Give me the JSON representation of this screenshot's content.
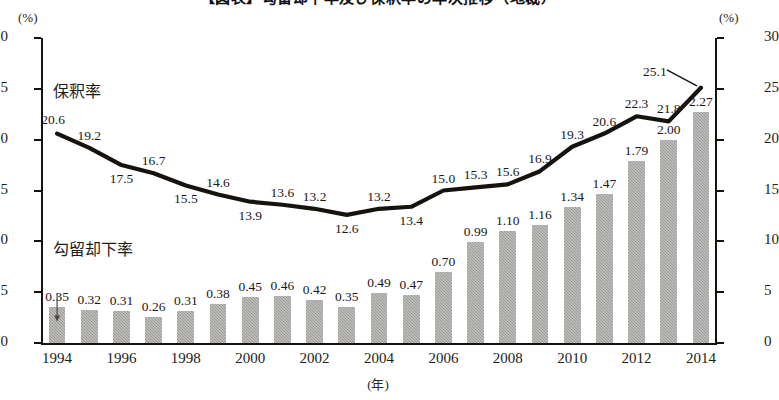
{
  "title": "【図表】勾留却下率及び保釈率の年次推移（地裁）",
  "axes": {
    "left_unit": "(%)",
    "right_unit": "(%)",
    "x_title": "(年)",
    "left_ticks": [
      "0.0",
      "0.5",
      "1.0",
      "1.5",
      "2.0",
      "2.5",
      "3.0"
    ],
    "right_ticks": [
      "0",
      "5",
      "10",
      "15",
      "20",
      "25",
      "30"
    ],
    "x_ticks": [
      "1994",
      "1996",
      "1998",
      "2000",
      "2002",
      "2004",
      "2006",
      "2008",
      "2010",
      "2012",
      "2014"
    ]
  },
  "series_labels": {
    "line": "保釈率",
    "bar": "勾留却下率"
  },
  "colors": {
    "line": "#16130f",
    "bar": "#a9a7a4",
    "axis": "#16130f",
    "text": "#1a1714"
  },
  "chart_data": {
    "type": "bar",
    "title": "【図表】勾留却下率及び保釈率の年次推移（地裁）",
    "xlabel": "(年)",
    "ylabel": "(%)",
    "ylim": [
      0.0,
      3.0
    ],
    "y2lim": [
      0,
      30
    ],
    "grid": false,
    "legend": "in-plot",
    "categories": [
      "1994",
      "1995",
      "1996",
      "1997",
      "1998",
      "1999",
      "2000",
      "2001",
      "2002",
      "2003",
      "2004",
      "2005",
      "2006",
      "2007",
      "2008",
      "2009",
      "2010",
      "2011",
      "2012",
      "2013",
      "2014"
    ],
    "series": [
      {
        "name": "勾留却下率",
        "type": "bar",
        "axis": "left",
        "unit": "%",
        "values": [
          0.35,
          0.32,
          0.31,
          0.26,
          0.31,
          0.38,
          0.45,
          0.46,
          0.42,
          0.35,
          0.49,
          0.47,
          0.7,
          0.99,
          1.1,
          1.16,
          1.34,
          1.47,
          1.79,
          2.0,
          2.27
        ],
        "labels": [
          "0.35",
          "0.32",
          "0.31",
          "0.26",
          "0.31",
          "0.38",
          "0.45",
          "0.46",
          "0.42",
          "0.35",
          "0.49",
          "0.47",
          "0.70",
          "0.99",
          "1.10",
          "1.16",
          "1.34",
          "1.47",
          "1.79",
          "2.00",
          "2.27"
        ]
      },
      {
        "name": "保釈率",
        "type": "line",
        "axis": "right",
        "unit": "%",
        "values": [
          20.6,
          19.2,
          17.5,
          16.7,
          15.5,
          14.6,
          13.9,
          13.6,
          13.2,
          12.6,
          13.2,
          13.4,
          15.0,
          15.3,
          15.6,
          16.9,
          19.3,
          20.6,
          22.3,
          21.8,
          25.1
        ],
        "labels": [
          "20.6",
          "19.2",
          "17.5",
          "16.7",
          "15.5",
          "14.6",
          "13.9",
          "13.6",
          "13.2",
          "12.6",
          "13.2",
          "13.4",
          "15.0",
          "15.3",
          "15.6",
          "16.9",
          "19.3",
          "20.6",
          "22.3",
          "21.8",
          "25.1"
        ]
      }
    ]
  }
}
